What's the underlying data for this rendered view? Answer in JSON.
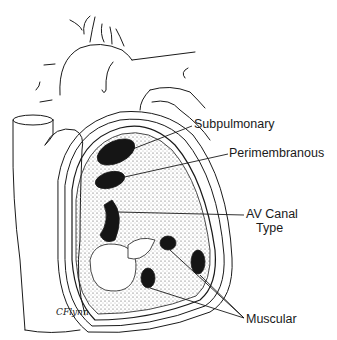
{
  "figure": {
    "labels": {
      "subpulmonary": "Subpulmonary",
      "perimembranous": "Perimembranous",
      "av_canal_line1": "AV Canal",
      "av_canal_line2": "Type",
      "muscular": "Muscular"
    },
    "signature": "CFlynn",
    "colors": {
      "ink": "#1a1a1a",
      "background": "#ffffff",
      "stipple": "#555555"
    }
  }
}
